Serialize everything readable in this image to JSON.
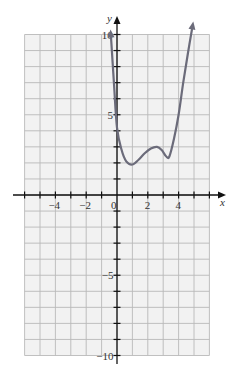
{
  "chart_data": {
    "type": "line",
    "title": "",
    "xlabel": "x",
    "ylabel": "y",
    "xlim": [
      -6,
      6
    ],
    "ylim": [
      -10,
      10
    ],
    "grid": true,
    "x_tick_labels": [
      "-4",
      "-2",
      "0",
      "2",
      "4"
    ],
    "y_tick_labels": [
      "10",
      "5",
      "-5",
      "-10"
    ],
    "series": [
      {
        "name": "f(x)",
        "color": "#6b6b7a",
        "points": [
          [
            -0.4,
            10
          ],
          [
            -0.2,
            7.0
          ],
          [
            0,
            4.2
          ],
          [
            0.3,
            2.8
          ],
          [
            0.6,
            2.1
          ],
          [
            1.0,
            1.9
          ],
          [
            1.4,
            2.2
          ],
          [
            1.8,
            2.6
          ],
          [
            2.2,
            2.9
          ],
          [
            2.6,
            3.0
          ],
          [
            2.9,
            2.8
          ],
          [
            3.2,
            2.4
          ],
          [
            3.4,
            2.4
          ],
          [
            3.7,
            3.5
          ],
          [
            4.0,
            5.0
          ],
          [
            4.3,
            7.0
          ],
          [
            4.6,
            8.8
          ],
          [
            4.9,
            10.5
          ]
        ],
        "end_arrows": true
      }
    ]
  },
  "colors": {
    "grid": "#b9b9b9",
    "grid_bg": "#f1f1f1",
    "axis": "#111111",
    "curve": "#6b6b7a"
  }
}
